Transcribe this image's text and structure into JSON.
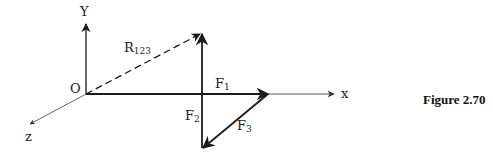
{
  "figure": {
    "caption": "Figure 2.70",
    "axes": {
      "x_label": "x",
      "y_label": "Y",
      "z_label": "z",
      "origin_label": "O"
    },
    "vectors": [
      {
        "name": "F1",
        "base": "F",
        "sub": "1",
        "from": "origin",
        "to": "+x",
        "style": "solid"
      },
      {
        "name": "F2",
        "base": "F",
        "sub": "2",
        "from": "tip of F3",
        "to": "up",
        "style": "solid"
      },
      {
        "name": "F3",
        "base": "F",
        "sub": "3",
        "from": "tip of F1",
        "to": "-x,-y",
        "style": "solid"
      },
      {
        "name": "R123",
        "base": "R",
        "sub": "123",
        "from": "origin",
        "to": "tip of F2",
        "style": "dashed"
      }
    ],
    "colors": {
      "line": "#1a1a1a",
      "axis": "#555555",
      "background": "#ffffff"
    }
  }
}
